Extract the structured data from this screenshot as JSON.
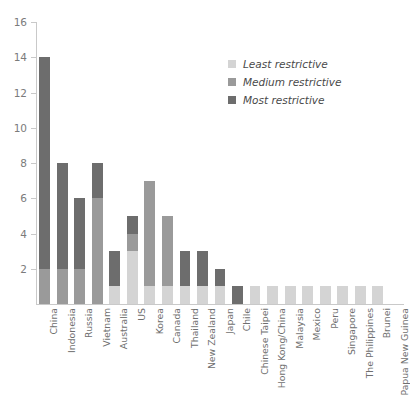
{
  "chart_data": {
    "type": "bar",
    "stacked": true,
    "title": "",
    "subtitle": "",
    "xlabel": "",
    "ylabel": "",
    "ylim": [
      0,
      16
    ],
    "ytick_values": [
      0,
      2,
      4,
      6,
      8,
      10,
      12,
      14,
      16
    ],
    "ytick_labels": [
      "",
      "2",
      "4",
      "6",
      "8",
      "10",
      "12",
      "14",
      "16"
    ],
    "grid": false,
    "legend_position": "top-right",
    "categories": [
      "China",
      "Indonesia",
      "Russia",
      "Vietnam",
      "Australia",
      "US",
      "Korea",
      "Canada",
      "Thailand",
      "New Zealand",
      "Japan",
      "Chile",
      "Chinese Taipei",
      "Hong Kong/China",
      "Malaysia",
      "Mexico",
      "Peru",
      "Singapore",
      "The Philippines",
      "Brunei",
      "Papua New Guinea"
    ],
    "series": [
      {
        "name": "Least restrictive",
        "color": "#d4d4d4",
        "values": [
          0,
          0,
          0,
          0,
          1,
          3,
          1,
          1,
          1,
          1,
          1,
          0,
          1,
          1,
          1,
          1,
          1,
          1,
          1,
          1,
          0
        ]
      },
      {
        "name": "Medium restrictive",
        "color": "#9a9a9a",
        "values": [
          2,
          2,
          2,
          6,
          0,
          1,
          6,
          4,
          0,
          0,
          0,
          0,
          0,
          0,
          0,
          0,
          0,
          0,
          0,
          0,
          0
        ]
      },
      {
        "name": "Most restrictive",
        "color": "#6d6d6d",
        "values": [
          12,
          6,
          4,
          2,
          2,
          1,
          0,
          0,
          2,
          2,
          1,
          1,
          0,
          0,
          0,
          0,
          0,
          0,
          0,
          0,
          0
        ]
      }
    ],
    "totals": [
      14,
      8,
      6,
      8,
      3,
      5,
      7,
      5,
      3,
      3,
      2,
      1,
      1,
      1,
      1,
      1,
      1,
      1,
      1,
      1,
      0
    ]
  },
  "legend": {
    "items": [
      {
        "label": "Least restrictive",
        "color": "#d4d4d4"
      },
      {
        "label": "Medium restrictive",
        "color": "#9a9a9a"
      },
      {
        "label": "Most restrictive",
        "color": "#6d6d6d"
      }
    ]
  },
  "axis": {
    "tick_color": "#c9c9c9",
    "label_color": "#7b7b7b"
  }
}
